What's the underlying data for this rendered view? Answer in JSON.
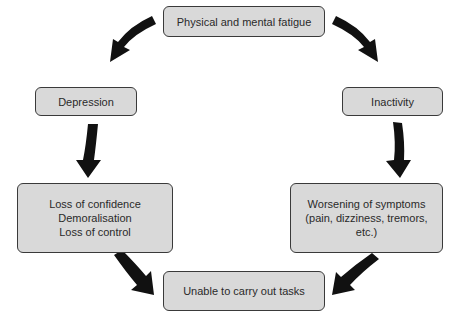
{
  "diagram": {
    "type": "cycle",
    "nodes": {
      "top": {
        "lines": [
          "Physical and mental fatigue"
        ]
      },
      "left_upper": {
        "lines": [
          "Depression"
        ]
      },
      "right_upper": {
        "lines": [
          "Inactivity"
        ]
      },
      "left_lower": {
        "lines": [
          "Loss of confidence",
          "Demoralisation",
          "Loss of control"
        ]
      },
      "right_lower": {
        "lines": [
          "Worsening of symptoms",
          "(pain, dizziness, tremors,",
          "etc.)"
        ]
      },
      "bottom": {
        "lines": [
          "Unable to carry out tasks"
        ]
      }
    },
    "edges": [
      {
        "from": "Physical and mental fatigue",
        "to": "Depression"
      },
      {
        "from": "Physical and mental fatigue",
        "to": "Inactivity"
      },
      {
        "from": "Depression",
        "to": "Loss of confidence / Demoralisation / Loss of control"
      },
      {
        "from": "Inactivity",
        "to": "Worsening of symptoms"
      },
      {
        "from": "Loss of confidence / Demoralisation / Loss of control",
        "to": "Unable to carry out tasks"
      },
      {
        "from": "Worsening of symptoms",
        "to": "Unable to carry out tasks"
      }
    ],
    "colors": {
      "box_fill": "#d9d9d9",
      "box_border": "#3a3a3a",
      "arrow": "#111111",
      "text": "#2a2a2a"
    }
  }
}
